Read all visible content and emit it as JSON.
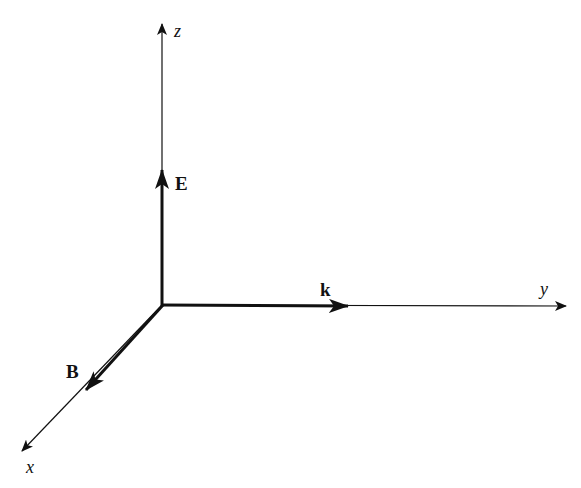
{
  "diagram": {
    "type": "3d-coordinate-axes",
    "colors": {
      "background": "#ffffff",
      "ink": "#111111"
    },
    "origin": {
      "x": 162,
      "y": 305
    },
    "axes": [
      {
        "id": "z",
        "label": "z",
        "tip": {
          "x": 162,
          "y": 24
        }
      },
      {
        "id": "y",
        "label": "y",
        "tip": {
          "x": 566,
          "y": 306
        }
      },
      {
        "id": "x",
        "label": "x",
        "tip": {
          "x": 22,
          "y": 451
        }
      }
    ],
    "vectors": [
      {
        "id": "E",
        "label": "E",
        "direction": "z",
        "tip": {
          "x": 162,
          "y": 170
        }
      },
      {
        "id": "k",
        "label": "k",
        "direction": "y",
        "tip": {
          "x": 348,
          "y": 306
        }
      },
      {
        "id": "B",
        "label": "B",
        "direction": "x",
        "tip": {
          "x": 86,
          "y": 390
        }
      }
    ]
  }
}
